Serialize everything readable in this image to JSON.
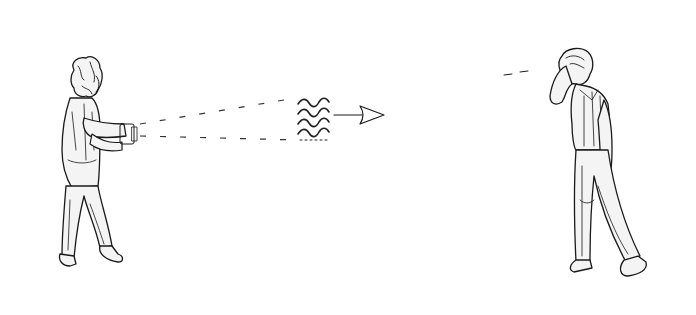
{
  "scene": {
    "description": "Line drawing: a person on the left aims a handheld device emitting a cone of waves toward a person on the right who holds a hand to their head",
    "colors": {
      "ink": "#1a1a1a",
      "background": "#ffffff",
      "shade": "#f4f4f4"
    },
    "elements": {
      "left_figure": "person-with-device",
      "beam": "dashed-cone",
      "waves": "sound-wave-packet",
      "arrow": "direction-arrow",
      "right_figure": "person-holding-head"
    }
  }
}
